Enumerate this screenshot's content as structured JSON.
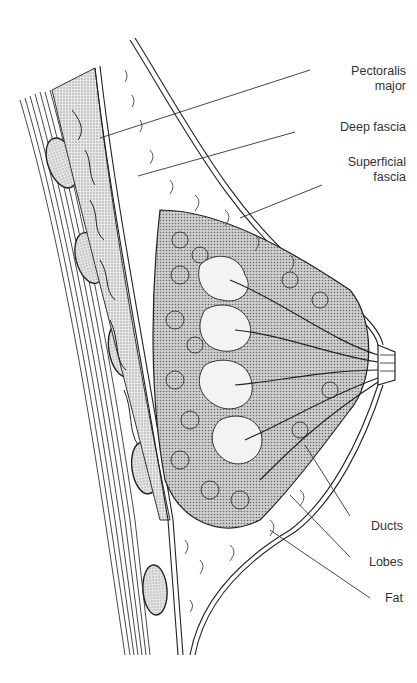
{
  "diagram": {
    "labels": [
      {
        "id": "pectoralis",
        "line1": "Pectoralis",
        "line2": "major"
      },
      {
        "id": "deep-fascia",
        "line1": "Deep fascia"
      },
      {
        "id": "superficial-fascia",
        "line1": "Superficial",
        "line2": "fascia"
      },
      {
        "id": "ducts",
        "line1": "Ducts"
      },
      {
        "id": "lobes",
        "line1": "Lobes"
      },
      {
        "id": "fat",
        "line1": "Fat"
      }
    ],
    "colors": {
      "ink": "#222222",
      "stipple": "#9a9a9a",
      "background": "#ffffff"
    }
  }
}
